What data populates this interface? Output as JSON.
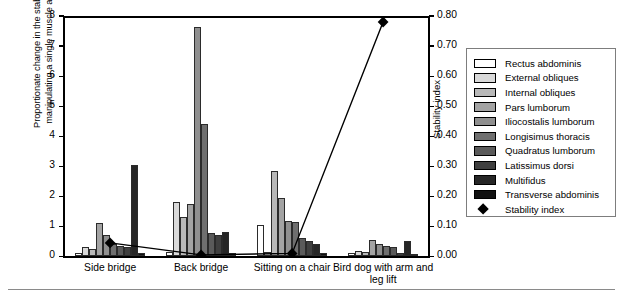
{
  "chart_data": {
    "type": "bar",
    "title": "",
    "xlabel": "",
    "ylabel": "Proportionate change in the stability index when manipulating a single muscle activation profile",
    "ylabel_right": "Stability index",
    "ylim": [
      0,
      8
    ],
    "yticks": [
      "0",
      "1",
      "2",
      "3",
      "4",
      "5",
      "6",
      "7",
      "8"
    ],
    "ylim_right": [
      0.0,
      0.8
    ],
    "yticks_right": [
      "0.00",
      "0.10",
      "0.20",
      "0.30",
      "0.40",
      "0.50",
      "0.60",
      "0.70",
      "0.80"
    ],
    "grid": false,
    "legend_position": "right",
    "categories": [
      "Side bridge",
      "Back bridge",
      "Sitting on a chair",
      "Bird dog with arm and leg lift"
    ],
    "series": [
      {
        "name": "Rectus abdominis",
        "color": "#ffffff",
        "values": [
          0.12,
          0.14,
          1.05,
          0.1
        ]
      },
      {
        "name": "External obliques",
        "color": "#d9d9d9",
        "values": [
          0.3,
          1.8,
          0.14,
          0.18
        ]
      },
      {
        "name": "Internal obliques",
        "color": "#b8b8b8",
        "values": [
          0.26,
          1.3,
          2.85,
          0.16
        ]
      },
      {
        "name": "Pars lumborum",
        "color": "#a3a3a3",
        "values": [
          1.1,
          1.75,
          1.95,
          0.55
        ]
      },
      {
        "name": "Iliocostalis lumborum",
        "color": "#8f8f8f",
        "values": [
          0.7,
          7.65,
          1.18,
          0.42
        ]
      },
      {
        "name": "Longisimus thoracis",
        "color": "#6f6f6f",
        "values": [
          0.4,
          4.4,
          1.15,
          0.36
        ]
      },
      {
        "name": "Quadratus lumborum",
        "color": "#5a5a5a",
        "values": [
          0.35,
          0.78,
          0.62,
          0.3
        ]
      },
      {
        "name": "Latissimus dorsi",
        "color": "#3f3f3f",
        "values": [
          0.32,
          0.7,
          0.52,
          0.12
        ]
      },
      {
        "name": "Multifidus",
        "color": "#262626",
        "values": [
          3.05,
          0.8,
          0.4,
          0.5
        ]
      },
      {
        "name": "Transverse abdominis",
        "color": "#111111",
        "values": [
          0.1,
          0.12,
          0.1,
          0.08
        ]
      }
    ],
    "overlay": {
      "name": "Stability index",
      "marker": "diamond",
      "color": "#000000",
      "axis": "right",
      "values": [
        0.045,
        0.005,
        0.01,
        0.78
      ]
    }
  },
  "legend": {
    "items": [
      {
        "label": "Rectus abdominis"
      },
      {
        "label": "External obliques"
      },
      {
        "label": "Internal obliques"
      },
      {
        "label": "Pars lumborum"
      },
      {
        "label": "Iliocostalis lumborum"
      },
      {
        "label": "Longisimus thoracis"
      },
      {
        "label": "Quadratus lumborum"
      },
      {
        "label": "Latissimus dorsi"
      },
      {
        "label": "Multifidus"
      },
      {
        "label": "Transverse abdominis"
      },
      {
        "label": "Stability index"
      }
    ]
  }
}
